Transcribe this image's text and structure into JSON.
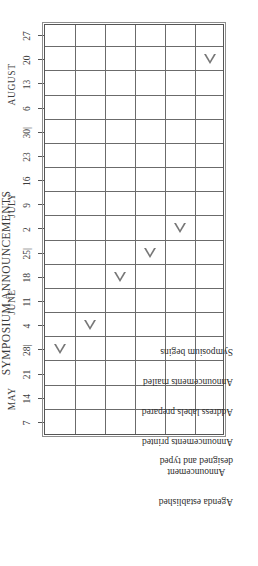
{
  "chart": {
    "title": "SYMPOSIUM ANNOUNCEMENTS"
  },
  "chart_data": {
    "type": "table",
    "title": "SYMPOSIUM ANNOUNCEMENTS",
    "xlabel": "",
    "ylabel": "",
    "grid": true,
    "legend": "none",
    "marker": "open-left-triangle",
    "months": [
      {
        "label": "MAY",
        "tick_index": 1
      },
      {
        "label": "JUNE",
        "tick_index": 5
      },
      {
        "label": "JULY",
        "tick_index": 9
      },
      {
        "label": "AUGUST",
        "tick_index": 14
      }
    ],
    "x_ticks": [
      "7",
      "14",
      "21",
      "28|",
      "4",
      "11",
      "18",
      "25|",
      "2",
      "9",
      "16",
      "23",
      "30|",
      "6",
      "13",
      "20",
      "27"
    ],
    "categories": [
      "Agenda established",
      "Announcement designed and typed",
      "Announcements printed",
      "Address labels prepared",
      "Announcements mailed",
      "Symposium begins"
    ],
    "milestones": [
      {
        "task": "Agenda established",
        "row": 0,
        "tick_index": 3,
        "date": "May 28"
      },
      {
        "task": "Announcement designed and typed",
        "row": 1,
        "tick_index": 4,
        "date": "June 4"
      },
      {
        "task": "Announcements printed",
        "row": 2,
        "tick_index": 6,
        "date": "June 18"
      },
      {
        "task": "Address labels prepared",
        "row": 3,
        "tick_index": 7,
        "date": "June 25"
      },
      {
        "task": "Announcements mailed",
        "row": 4,
        "tick_index": 8,
        "date": "July 2"
      },
      {
        "task": "Symposium begins",
        "row": 5,
        "tick_index": 15,
        "date": "August 20"
      }
    ]
  }
}
